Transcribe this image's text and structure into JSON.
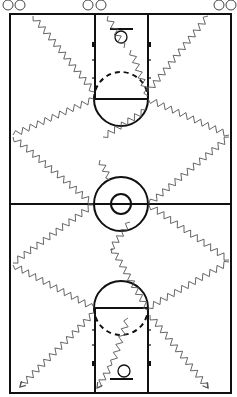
{
  "diagram": {
    "type": "basketball-full-court-drill",
    "colors": {
      "court_lines": "#111111",
      "dribble_paths": "#555555",
      "background": "#ffffff"
    },
    "court": {
      "left": 10,
      "top": 14,
      "right": 231,
      "bottom": 393,
      "lane_left": 95,
      "lane_right": 148,
      "half_court_y": 204
    },
    "center_circle": {
      "cx": 121,
      "cy": 204,
      "r_outer": 27,
      "r_inner": 10
    },
    "keys": [
      {
        "name": "top-key",
        "free_throw_y": 99,
        "cx": 121,
        "r": 27,
        "solid_side": "down",
        "dashed_side": "up"
      },
      {
        "name": "bottom-key",
        "free_throw_y": 308,
        "cx": 121,
        "r": 27,
        "solid_side": "up",
        "dashed_side": "down"
      }
    ],
    "baskets": [
      {
        "name": "top-basket",
        "backboard_y": 29,
        "backboard_x1": 110,
        "backboard_x2": 133,
        "hoop_cx": 121,
        "hoop_cy": 37,
        "hoop_r": 6
      },
      {
        "name": "bottom-basket",
        "backboard_y": 379,
        "backboard_x1": 110,
        "backboard_x2": 133,
        "hoop_cx": 124,
        "hoop_cy": 371,
        "hoop_r": 6
      }
    ],
    "players": [
      {
        "label": "player-1",
        "cx": 8,
        "cy": 5
      },
      {
        "label": "player-2",
        "cx": 20,
        "cy": 5
      },
      {
        "label": "player-3",
        "cx": 88,
        "cy": 5
      },
      {
        "label": "player-4",
        "cx": 101,
        "cy": 5
      },
      {
        "label": "player-5",
        "cx": 219,
        "cy": 5
      },
      {
        "label": "player-6",
        "cx": 231,
        "cy": 5
      }
    ],
    "dribble_paths": [
      {
        "name": "left-lane-down-to-elbow",
        "points": [
          [
            33,
            16
          ],
          [
            94,
            92
          ]
        ]
      },
      {
        "name": "left-elbow-to-sideline",
        "points": [
          [
            94,
            99
          ],
          [
            13,
            135
          ]
        ]
      },
      {
        "name": "left-sideline-to-center",
        "points": [
          [
            13,
            137
          ],
          [
            93,
            204
          ]
        ]
      },
      {
        "name": "left-center-to-sideline",
        "points": [
          [
            93,
            205
          ],
          [
            13,
            263
          ]
        ]
      },
      {
        "name": "left-sideline-to-bottom-elbow",
        "points": [
          [
            13,
            265
          ],
          [
            94,
            308
          ]
        ]
      },
      {
        "name": "left-bottom-elbow-to-corner",
        "points": [
          [
            94,
            313
          ],
          [
            20,
            387
          ]
        ]
      },
      {
        "name": "middle-top-basket-down",
        "points": [
          [
            108,
            16
          ],
          [
            124,
            48
          ]
        ]
      },
      {
        "name": "middle-top-to-right-elbow",
        "points": [
          [
            131,
            50
          ],
          [
            148,
            96
          ]
        ]
      },
      {
        "name": "middle-key-to-left-crossing",
        "points": [
          [
            146,
            110
          ],
          [
            103,
            137
          ]
        ]
      },
      {
        "name": "middle-left-to-center",
        "points": [
          [
            100,
            160
          ],
          [
            110,
            180
          ]
        ]
      },
      {
        "name": "center-to-middle-down",
        "points": [
          [
            130,
            222
          ],
          [
            110,
            250
          ]
        ]
      },
      {
        "name": "middle-down-to-bottom-key",
        "points": [
          [
            112,
            248
          ],
          [
            148,
            310
          ]
        ]
      },
      {
        "name": "bottom-key-to-bottom-basket",
        "points": [
          [
            128,
            318
          ],
          [
            112,
            365
          ]
        ]
      },
      {
        "name": "bottom-basket-to-corner",
        "points": [
          [
            112,
            365
          ],
          [
            97,
            388
          ]
        ]
      },
      {
        "name": "right-lane-up-to-elbow",
        "points": [
          [
            208,
            16
          ],
          [
            148,
            92
          ]
        ]
      },
      {
        "name": "right-elbow-to-sideline",
        "points": [
          [
            148,
            99
          ],
          [
            229,
            135
          ]
        ]
      },
      {
        "name": "right-sideline-to-center",
        "points": [
          [
            229,
            137
          ],
          [
            149,
            204
          ]
        ]
      },
      {
        "name": "right-center-to-sideline",
        "points": [
          [
            149,
            205
          ],
          [
            229,
            260
          ]
        ]
      },
      {
        "name": "right-sideline-to-bottom-elbow",
        "points": [
          [
            229,
            262
          ],
          [
            148,
            308
          ]
        ]
      },
      {
        "name": "right-bottom-elbow-to-corner",
        "points": [
          [
            150,
            315
          ],
          [
            208,
            388
          ]
        ]
      }
    ],
    "arrowheads": [
      {
        "name": "arrow-bottom-left",
        "tip": [
          20,
          387
        ],
        "from": [
          30,
          377
        ]
      },
      {
        "name": "arrow-bottom-middle",
        "tip": [
          97,
          388
        ],
        "from": [
          104,
          378
        ]
      },
      {
        "name": "arrow-bottom-right",
        "tip": [
          208,
          388
        ],
        "from": [
          200,
          378
        ]
      }
    ]
  }
}
